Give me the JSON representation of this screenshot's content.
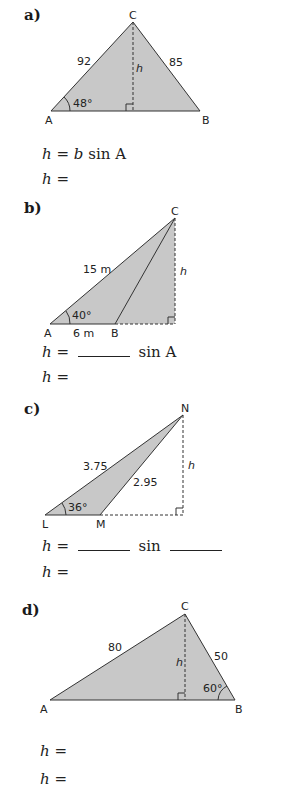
{
  "parts": [
    {
      "label": "a)",
      "vertices": {
        "A": "A",
        "B": "B",
        "C": "C"
      },
      "sides": {
        "AC": "92",
        "BC": "85"
      },
      "angle": "48°",
      "height_label": "h",
      "equations": [
        {
          "lhs": "h",
          "eq": "=",
          "rhs_var": "b",
          "rhs_rest": "sin A"
        },
        {
          "lhs": "h",
          "eq": "="
        }
      ]
    },
    {
      "label": "b)",
      "vertices": {
        "A": "A",
        "B": "B",
        "C": "C"
      },
      "sides": {
        "AC": "15 m",
        "AB": "6 m"
      },
      "angle": "40°",
      "height_label": "h",
      "equations": [
        {
          "lhs": "h",
          "eq": "=",
          "rhs_rest": "sin A"
        },
        {
          "lhs": "h",
          "eq": "="
        }
      ]
    },
    {
      "label": "c)",
      "vertices": {
        "L": "L",
        "M": "M",
        "N": "N"
      },
      "sides": {
        "LN": "3.75",
        "MN": "2.95"
      },
      "angle": "36°",
      "height_label": "h",
      "equations": [
        {
          "lhs": "h",
          "eq": "=",
          "rhs_rest": "sin"
        },
        {
          "lhs": "h",
          "eq": "="
        }
      ]
    },
    {
      "label": "d)",
      "vertices": {
        "A": "A",
        "B": "B",
        "C": "C"
      },
      "sides": {
        "AC": "80",
        "BC": "50"
      },
      "angle": "60°",
      "height_label": "h",
      "equations": [
        {
          "lhs": "h",
          "eq": "="
        },
        {
          "lhs": "h",
          "eq": "="
        }
      ]
    }
  ],
  "colors": {
    "fill": "#c8c8c8",
    "stroke": "#333333"
  }
}
